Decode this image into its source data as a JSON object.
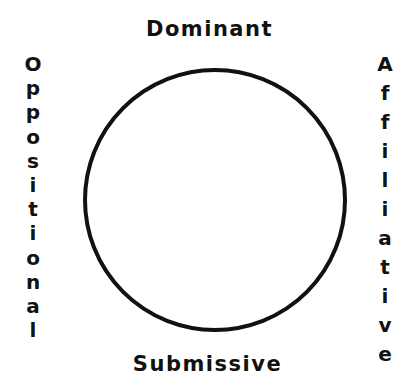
{
  "diagram": {
    "type": "circumplex",
    "shape": "circle",
    "stroke_color": "#111111",
    "axes": {
      "top": "Dominant",
      "bottom": "Submissive",
      "left": "Oppositional",
      "right": "Affiliative"
    },
    "left_letters": [
      "O",
      "p",
      "p",
      "o",
      "s",
      "i",
      "t",
      "i",
      "o",
      "n",
      "a",
      "l"
    ],
    "right_letters": [
      "A",
      "f",
      "f",
      "i",
      "l",
      "i",
      "a",
      "t",
      "i",
      "v",
      "e"
    ]
  }
}
